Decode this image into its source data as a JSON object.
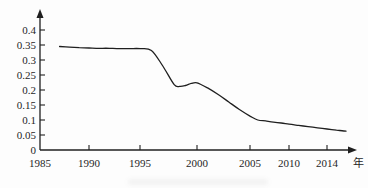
{
  "figure": {
    "background": "#fdfdfd",
    "ink_color": "#1f1f1f",
    "x_axis_unit_label": "年"
  },
  "chart_data": {
    "type": "line",
    "title": "",
    "xlabel": "年",
    "ylabel": "",
    "grid": false,
    "legend": null,
    "xlim": [
      1985,
      2017
    ],
    "ylim": [
      0,
      0.44
    ],
    "x_ticks": [
      1985,
      1990,
      1995,
      2000,
      2005,
      2010,
      2014
    ],
    "x_tick_labels": [
      "1985",
      "1990",
      "1995",
      "2000",
      "2005",
      "2010",
      "2014"
    ],
    "y_ticks": [
      0,
      0.05,
      0.1,
      0.15,
      0.2,
      0.25,
      0.3,
      0.35,
      0.4
    ],
    "y_tick_labels": [
      "0",
      "0.05",
      "0.1",
      "0.15",
      "0.2",
      "0.25",
      "0.3",
      "0.35",
      "0.4"
    ],
    "series": [
      {
        "name": "trend-line",
        "x": [
          1987,
          1988,
          1989,
          1990,
          1991,
          1992,
          1993,
          1994,
          1995,
          1996,
          1997,
          1998,
          1998.5,
          1999,
          1999.5,
          2000,
          2001,
          2002,
          2003,
          2004,
          2005,
          2006,
          2007,
          2008,
          2009,
          2010,
          2011,
          2012,
          2013,
          2014,
          2015,
          2016
        ],
        "y": [
          0.345,
          0.343,
          0.341,
          0.34,
          0.339,
          0.339,
          0.338,
          0.338,
          0.338,
          0.332,
          0.28,
          0.218,
          0.212,
          0.215,
          0.222,
          0.224,
          0.207,
          0.185,
          0.16,
          0.135,
          0.113,
          0.1,
          0.097,
          0.093,
          0.09,
          0.086,
          0.082,
          0.078,
          0.074,
          0.07,
          0.066,
          0.063
        ]
      }
    ]
  }
}
